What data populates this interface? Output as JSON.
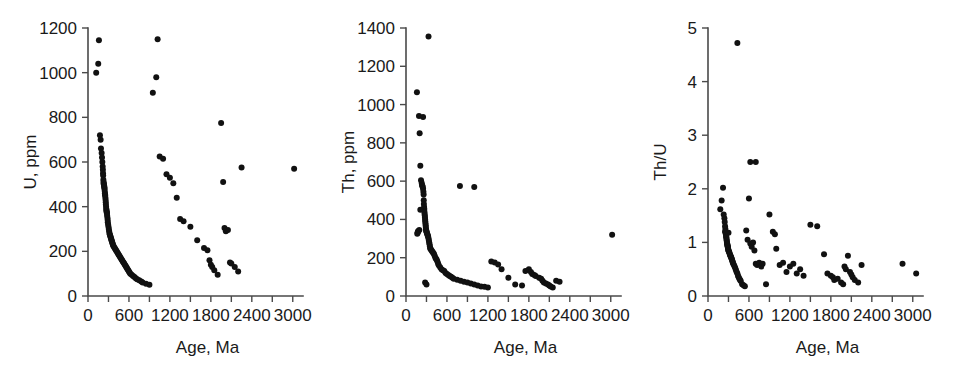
{
  "figure": {
    "name": "zircon-geochemistry-age-scatter-panels",
    "background": "#ffffff",
    "marker_color": "#111111",
    "axis_color": "#4a4a4a"
  },
  "chart_data": [
    {
      "type": "scatter",
      "panel_index": 0,
      "title": "",
      "xlabel": "Age, Ma",
      "ylabel": "U, ppm",
      "xlim": [
        0,
        3150
      ],
      "ylim": [
        0,
        1200
      ],
      "xticks": [
        0,
        300,
        600,
        900,
        1200,
        1500,
        1800,
        2100,
        2400,
        2700,
        3000
      ],
      "xtick_labels": [
        "0",
        "",
        "600",
        "",
        "1200",
        "",
        "1800",
        "",
        "2400",
        "",
        "3000"
      ],
      "yticks": [
        0,
        200,
        400,
        600,
        800,
        1000,
        1200
      ],
      "ytick_labels": [
        "0",
        "200",
        "400",
        "600",
        "800",
        "1000",
        "1200"
      ],
      "grid": false,
      "legend": null,
      "x": [
        120,
        150,
        160,
        175,
        185,
        190,
        200,
        205,
        210,
        215,
        218,
        220,
        222,
        225,
        228,
        230,
        232,
        235,
        238,
        240,
        242,
        245,
        248,
        250,
        252,
        255,
        258,
        260,
        262,
        265,
        268,
        270,
        272,
        275,
        278,
        280,
        285,
        288,
        290,
        295,
        300,
        305,
        310,
        315,
        320,
        325,
        330,
        335,
        340,
        345,
        350,
        355,
        360,
        365,
        370,
        380,
        390,
        400,
        410,
        420,
        430,
        440,
        450,
        460,
        470,
        480,
        490,
        500,
        510,
        520,
        530,
        540,
        550,
        560,
        570,
        580,
        590,
        600,
        610,
        620,
        640,
        660,
        680,
        700,
        720,
        750,
        780,
        800,
        850,
        900,
        950,
        1000,
        1020,
        1050,
        1100,
        1150,
        1200,
        1250,
        1300,
        1350,
        1400,
        1500,
        1600,
        1700,
        1750,
        1780,
        1800,
        1820,
        1850,
        1900,
        1950,
        1980,
        2000,
        2020,
        2050,
        2080,
        2100,
        2150,
        2200,
        2250,
        3020
      ],
      "y": [
        1000,
        1040,
        1145,
        720,
        700,
        660,
        640,
        620,
        600,
        580,
        565,
        550,
        540,
        520,
        510,
        505,
        500,
        495,
        490,
        485,
        480,
        470,
        460,
        455,
        450,
        440,
        430,
        420,
        410,
        400,
        390,
        385,
        380,
        375,
        370,
        360,
        350,
        340,
        330,
        320,
        310,
        300,
        290,
        280,
        275,
        270,
        265,
        260,
        255,
        250,
        245,
        240,
        235,
        230,
        225,
        220,
        215,
        210,
        205,
        200,
        195,
        190,
        185,
        180,
        175,
        170,
        165,
        160,
        155,
        150,
        145,
        140,
        135,
        130,
        125,
        120,
        115,
        110,
        105,
        100,
        95,
        90,
        85,
        80,
        75,
        70,
        65,
        60,
        55,
        50,
        910,
        980,
        1150,
        625,
        615,
        545,
        530,
        505,
        440,
        345,
        335,
        310,
        250,
        215,
        205,
        160,
        140,
        130,
        115,
        95,
        775,
        510,
        305,
        290,
        295,
        150,
        145,
        130,
        110,
        575,
        570,
        455,
        490,
        470,
        465,
        280,
        160,
        150,
        105,
        75,
        60,
        45,
        50
      ],
      "n_points": 125
    },
    {
      "type": "scatter",
      "panel_index": 1,
      "title": "",
      "xlabel": "Age, Ma",
      "ylabel": "Th, ppm",
      "xlim": [
        0,
        3150
      ],
      "ylim": [
        0,
        1400
      ],
      "xticks": [
        0,
        300,
        600,
        900,
        1200,
        1500,
        1800,
        2100,
        2400,
        2700,
        3000
      ],
      "xtick_labels": [
        "0",
        "",
        "600",
        "",
        "1200",
        "",
        "1800",
        "",
        "2400",
        "",
        "3000"
      ],
      "yticks": [
        0,
        200,
        400,
        600,
        800,
        1000,
        1200,
        1400
      ],
      "ytick_labels": [
        "0",
        "200",
        "400",
        "600",
        "800",
        "1000",
        "1200",
        "1400"
      ],
      "grid": false,
      "legend": null,
      "x": [
        160,
        190,
        200,
        210,
        220,
        230,
        235,
        240,
        245,
        250,
        255,
        258,
        260,
        262,
        265,
        268,
        270,
        272,
        275,
        278,
        280,
        282,
        285,
        288,
        290,
        292,
        295,
        298,
        300,
        305,
        310,
        315,
        320,
        325,
        330,
        335,
        340,
        345,
        350,
        355,
        360,
        370,
        380,
        390,
        400,
        410,
        420,
        430,
        440,
        450,
        460,
        470,
        480,
        500,
        520,
        540,
        560,
        580,
        600,
        620,
        640,
        660,
        680,
        700,
        750,
        800,
        850,
        900,
        950,
        1000,
        1050,
        1100,
        1150,
        1200,
        1250,
        1300,
        1350,
        1400,
        1500,
        1600,
        1700,
        1750,
        1800,
        1830,
        1850,
        1880,
        1900,
        1950,
        1980,
        2000,
        2020,
        2050,
        2080,
        2100,
        2120,
        2150,
        2200,
        2250,
        280,
        300,
        330,
        790,
        1000,
        250,
        210,
        195,
        180,
        175,
        170,
        165,
        3020
      ],
      "y": [
        1065,
        940,
        850,
        680,
        605,
        590,
        580,
        575,
        570,
        560,
        545,
        530,
        500,
        480,
        465,
        455,
        440,
        430,
        420,
        410,
        400,
        390,
        380,
        370,
        360,
        350,
        345,
        340,
        335,
        330,
        325,
        320,
        315,
        310,
        300,
        290,
        280,
        270,
        260,
        250,
        245,
        240,
        235,
        230,
        225,
        220,
        210,
        200,
        195,
        190,
        180,
        170,
        160,
        150,
        140,
        135,
        130,
        120,
        115,
        110,
        105,
        100,
        95,
        90,
        85,
        80,
        75,
        70,
        65,
        60,
        55,
        50,
        48,
        45,
        180,
        175,
        165,
        140,
        95,
        60,
        55,
        130,
        140,
        125,
        115,
        110,
        105,
        95,
        90,
        80,
        70,
        65,
        60,
        55,
        50,
        45,
        80,
        75,
        70,
        60,
        1355,
        575,
        570,
        935,
        450,
        345,
        340,
        335,
        330,
        325,
        320,
        315,
        30
      ],
      "n_points": 113
    },
    {
      "type": "scatter",
      "panel_index": 2,
      "title": "",
      "xlabel": "Age, Ma",
      "ylabel": "Th/U",
      "xlim": [
        0,
        3150
      ],
      "ylim": [
        0,
        5
      ],
      "xticks": [
        0,
        300,
        600,
        900,
        1200,
        1500,
        1800,
        2100,
        2400,
        2700,
        3000
      ],
      "xtick_labels": [
        "0",
        "",
        "600",
        "",
        "1200",
        "",
        "1800",
        "",
        "2400",
        "",
        "3000"
      ],
      "yticks": [
        0,
        1,
        2,
        3,
        4,
        5
      ],
      "ytick_labels": [
        "0",
        "1",
        "2",
        "3",
        "4",
        "5"
      ],
      "grid": false,
      "legend": null,
      "x": [
        180,
        200,
        220,
        230,
        240,
        245,
        250,
        255,
        258,
        260,
        262,
        265,
        268,
        270,
        272,
        275,
        278,
        280,
        282,
        285,
        288,
        290,
        292,
        295,
        298,
        300,
        305,
        310,
        315,
        320,
        325,
        330,
        335,
        340,
        345,
        350,
        355,
        360,
        365,
        370,
        380,
        390,
        400,
        410,
        420,
        430,
        440,
        450,
        460,
        470,
        480,
        500,
        520,
        540,
        560,
        580,
        600,
        620,
        640,
        660,
        680,
        700,
        720,
        750,
        780,
        800,
        850,
        900,
        950,
        980,
        1000,
        1050,
        1100,
        1150,
        1200,
        1250,
        1300,
        1350,
        1400,
        1500,
        1600,
        1700,
        1750,
        1800,
        1830,
        1850,
        1900,
        1950,
        1980,
        2000,
        2020,
        2050,
        2080,
        2100,
        2120,
        2150,
        2200,
        2250,
        430,
        620,
        700,
        300,
        250,
        2850,
        3050
      ],
      "y": [
        1.62,
        1.78,
        2.02,
        1.52,
        1.45,
        1.38,
        1.3,
        1.25,
        1.2,
        1.18,
        1.15,
        1.12,
        1.1,
        1.08,
        1.05,
        1.03,
        1.0,
        0.98,
        0.96,
        0.95,
        0.93,
        0.92,
        0.9,
        0.88,
        0.86,
        0.85,
        0.83,
        0.82,
        0.8,
        0.78,
        0.76,
        0.75,
        0.73,
        0.72,
        0.7,
        0.68,
        0.66,
        0.64,
        0.62,
        0.6,
        0.58,
        0.55,
        0.52,
        0.48,
        0.45,
        0.42,
        0.38,
        0.35,
        0.32,
        0.3,
        0.28,
        0.22,
        0.2,
        0.18,
        1.22,
        1.05,
        1.82,
        0.98,
        0.92,
        1.0,
        0.85,
        0.6,
        0.58,
        0.62,
        0.55,
        0.6,
        0.22,
        1.52,
        1.2,
        1.15,
        0.88,
        0.58,
        0.62,
        0.45,
        0.55,
        0.6,
        0.42,
        0.5,
        0.38,
        1.33,
        1.3,
        0.78,
        0.42,
        0.38,
        0.35,
        0.3,
        0.32,
        0.25,
        0.22,
        0.55,
        0.5,
        0.75,
        0.45,
        0.4,
        0.35,
        0.3,
        0.25,
        0.58,
        4.72,
        2.5,
        2.5,
        1.18,
        1.2,
        0.6,
        0.42
      ],
      "n_points": 106
    }
  ]
}
